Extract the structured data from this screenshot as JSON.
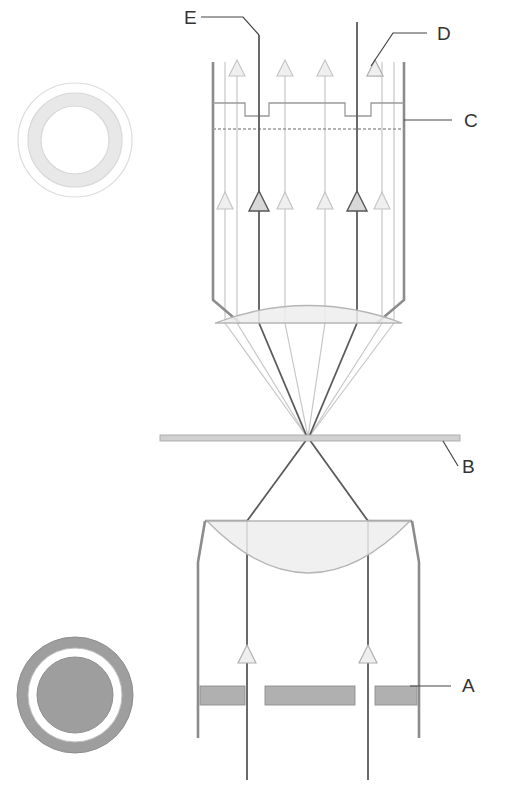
{
  "figure": {
    "type": "optical-ray-diagram",
    "width": 519,
    "height": 792,
    "background": "#ffffff"
  },
  "colors": {
    "label_text": "#333333",
    "leader_line": "#444444",
    "tube_wall": "#8c8c8c",
    "ray_direct": "#5a5a5a",
    "ray_diffracted": "#bdbdbd",
    "arrow_dark_fill": "#d8d8d8",
    "arrow_dark_stroke": "#555555",
    "arrow_light_fill": "#ededed",
    "arrow_light_stroke": "#bdbdbd",
    "lens_fill": "#ededed",
    "lens_stroke": "#b5b5b5",
    "specimen_plane_fill": "#d0d0d0",
    "specimen_plane_stroke": "#a8a8a8",
    "aperture_block_fill": "#b0b0b0",
    "aperture_block_stroke": "#888888",
    "phase_plate_stroke": "#9a9a9a",
    "ring_top_outer_stroke": "#d5d5d5",
    "ring_top_annulus_fill": "#e6e6e6",
    "ring_bottom_fill": "#9e9e9e",
    "ring_bottom_gap": "#ffffff"
  },
  "labels": [
    {
      "id": "A",
      "text": "A",
      "name": "annular-aperture",
      "x": 462,
      "y": 692
    },
    {
      "id": "B",
      "text": "B",
      "name": "specimen-plane",
      "x": 462,
      "y": 470
    },
    {
      "id": "C",
      "text": "C",
      "name": "phase-plate",
      "x": 464,
      "y": 121
    },
    {
      "id": "D",
      "text": "D",
      "name": "diffracted-ray",
      "x": 437,
      "y": 39
    },
    {
      "id": "E",
      "text": "E",
      "name": "direct-ray",
      "x": 188,
      "y": 22
    }
  ],
  "leaders": [
    {
      "for": "A",
      "points": "410,686 451,686"
    },
    {
      "for": "B",
      "points": "443,441 458,466"
    },
    {
      "for": "C",
      "points": "404,120 452,120"
    },
    {
      "for": "D",
      "points": "427,33 393,33 371,66"
    },
    {
      "for": "E",
      "points": "201,17 243,17 259,35"
    }
  ],
  "insets": [
    {
      "name": "ring-inset-top",
      "cx": 75,
      "cy": 140,
      "r_outer": 57,
      "r_mid": 47,
      "r_inner": 34,
      "description": "Outer thin circle with light gray annulus — phase plate annular groove"
    },
    {
      "name": "ring-inset-bottom",
      "cx": 75,
      "cy": 695,
      "r_outer": 58,
      "r_mid": 47,
      "r_inner": 38,
      "description": "Dark gray ring with white gap and dark gray center disc — annular aperture"
    }
  ],
  "components": {
    "tube": {
      "name": "objective-tube",
      "left_x": 213,
      "right_x": 404,
      "top_y": 62,
      "taper_y": 300,
      "lens_y": 323
    },
    "phase_plate": {
      "name": "phase-plate",
      "top_y": 103,
      "bottom_y": 129,
      "notch_depth": 13,
      "notch1_x0": 245,
      "notch1_x1": 269,
      "notch2_x0": 345,
      "notch2_x1": 371
    },
    "objective_lens": {
      "name": "objective-lens",
      "left_x": 213,
      "right_x": 404,
      "flat_y": 323,
      "dome_top_y": 300
    },
    "specimen_plane": {
      "name": "specimen-plane",
      "x0": 160,
      "x1": 460,
      "y": 438,
      "thickness": 6
    },
    "condenser_lens": {
      "name": "condenser-lens",
      "left_x": 205,
      "right_x": 412,
      "flat_y": 521,
      "dome_bottom_y": 603
    },
    "condenser_body": {
      "name": "condenser-housing",
      "left_x": 198,
      "right_x": 419,
      "shoulder_y": 521,
      "bevel_y": 562,
      "bottom_y": 738
    },
    "aperture_blocks": [
      {
        "name": "aperture-block-left",
        "x": 200,
        "y": 686,
        "w": 45,
        "h": 19
      },
      {
        "name": "aperture-block-center",
        "x": 265,
        "y": 686,
        "w": 90,
        "h": 19
      },
      {
        "name": "aperture-block-right",
        "x": 375,
        "y": 686,
        "w": 42,
        "h": 19
      }
    ]
  },
  "rays": {
    "direct": [
      {
        "name": "direct-ray-left",
        "x_top": 259,
        "x_focus": 308,
        "x_bottom": 247
      },
      {
        "name": "direct-ray-right",
        "x_top": 357,
        "x_focus": 308,
        "x_bottom": 368
      }
    ],
    "diffracted": [
      {
        "name": "diffracted-ray-1",
        "x_top": 225
      },
      {
        "name": "diffracted-ray-2",
        "x_top": 237
      },
      {
        "name": "diffracted-ray-3",
        "x_top": 285
      },
      {
        "name": "diffracted-ray-4",
        "x_top": 325
      },
      {
        "name": "diffracted-ray-5",
        "x_top": 382
      },
      {
        "name": "diffracted-ray-6",
        "x_top": 394
      }
    ],
    "arrow_rows": {
      "upper_y": 70,
      "middle_y": 200,
      "condenser_y": 655
    }
  }
}
